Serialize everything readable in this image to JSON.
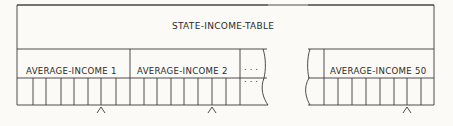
{
  "diagram": {
    "title": "STATE-INCOME-TABLE",
    "groups": [
      {
        "label": "AVERAGE-INCOME 1",
        "cells": 8,
        "caret_cell": 6
      },
      {
        "label": "AVERAGE-INCOME 2",
        "cells": 8,
        "caret_cell": 6
      },
      {
        "label": "AVERAGE-INCOME 50",
        "cells": 8,
        "caret_cell": 6
      }
    ],
    "ellipsis_top": ". . .",
    "ellipsis_bottom": ". . .",
    "colors": {
      "line": "#3a3a3a",
      "background": "#fbfaf6",
      "text": "#2b2b2b"
    }
  }
}
